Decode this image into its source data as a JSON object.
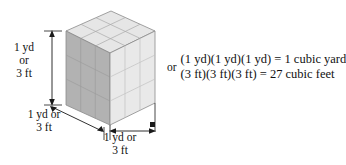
{
  "figure": {
    "solid": {
      "name": "cube",
      "subdivisions_per_edge": 3,
      "total_small_cubes": 27,
      "top_face_color": "#e6e6e6",
      "left_face_color": "#b2b2b2",
      "front_face_color": "#e9e9e9",
      "edge_color": "#9a9a9a",
      "outline_color": "#8a8a8a"
    },
    "dimension_labels": {
      "height": "1 yd\nor\n3 ft",
      "height_line1": "1 yd",
      "height_line2": "or",
      "height_line3": "3 ft",
      "depth_line1": "1 yd or",
      "depth_line2": "3 ft",
      "width_line1": "1 yd or",
      "width_line2": "3 ft"
    },
    "equations": {
      "connector": "or",
      "line1": "(1 yd)(1 yd)(1 yd)  =  1 cubic yard",
      "line2": "(3 ft)(3 ft)(3 ft)  =  27 cubic feet"
    }
  }
}
